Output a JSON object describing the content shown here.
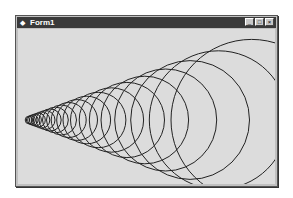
{
  "window": {
    "title": "Form1",
    "controls": {
      "minimize": "_",
      "maximize": "□",
      "close": "×"
    }
  },
  "drawing": {
    "description": "Series of concentric-growth circles tangent to a cone",
    "stroke_color": "#222222",
    "background_color": "#dcdcdc",
    "apex_x": 0,
    "center_y": 91,
    "sin_half_angle": 0.345,
    "first_radius": 3.8,
    "ratio": 1.165,
    "count": 21
  }
}
